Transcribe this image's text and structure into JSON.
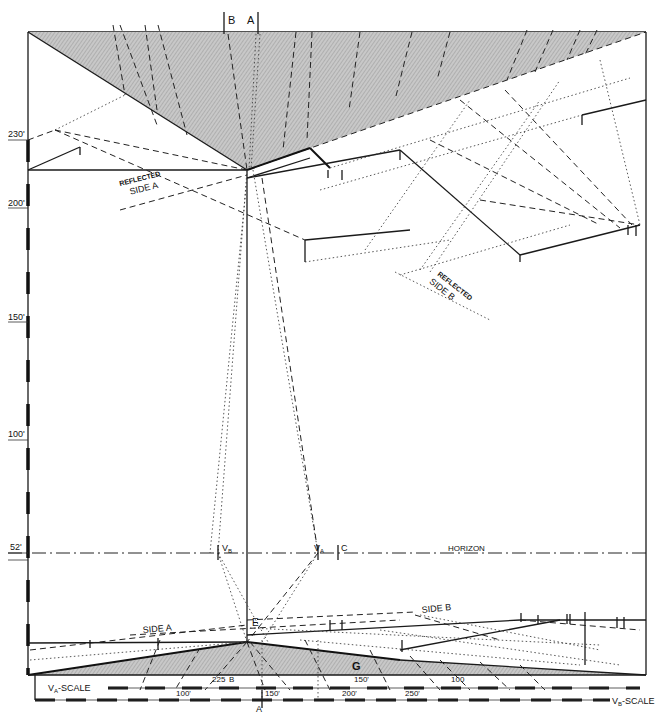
{
  "drawing": {
    "title": "Perspective construction of reflections on water",
    "colors": {
      "ink": "#111111",
      "shade": "#bdbdbd",
      "paper": "#ffffff"
    },
    "top_markers": {
      "b": "B",
      "a": "A"
    },
    "vertical_scale": {
      "labels": [
        {
          "text": "230'",
          "y": 136
        },
        {
          "text": "200'",
          "y": 206
        },
        {
          "text": "150'",
          "y": 320
        },
        {
          "text": "100'",
          "y": 437
        },
        {
          "text": "52'",
          "y": 548
        }
      ]
    },
    "annotations": {
      "reflected_side_a_line1": "REFLECTED",
      "reflected_side_a_line2": "SIDE A",
      "reflected_side_b_line1": "REFLECTED",
      "reflected_side_b_line2": "SIDE B",
      "side_a": "SIDE A",
      "side_b": "SIDE B",
      "horizon": "HORIZON",
      "vb": "V",
      "vb_sub": "B",
      "va": "V",
      "va_sub": "A",
      "c": "C",
      "e": "E",
      "g": "G"
    },
    "bottom_scales": {
      "va_scale_label": "V",
      "va_scale_sub": "A",
      "va_scale_suffix": "-SCALE",
      "vb_scale_label": "V",
      "vb_scale_sub": "B",
      "vb_scale_suffix": "-SCALE",
      "va_ticks": [
        {
          "text": "225",
          "x": 212
        },
        {
          "text": "B",
          "x": 229
        },
        {
          "text": "100'",
          "x": 176
        },
        {
          "text": "150'",
          "x": 357
        },
        {
          "text": "100",
          "x": 451
        }
      ],
      "vb_ticks": [
        {
          "text": "150'",
          "x": 265
        },
        {
          "text": "200'",
          "x": 342
        },
        {
          "text": "250'",
          "x": 405
        }
      ],
      "a_marker": "A"
    }
  }
}
